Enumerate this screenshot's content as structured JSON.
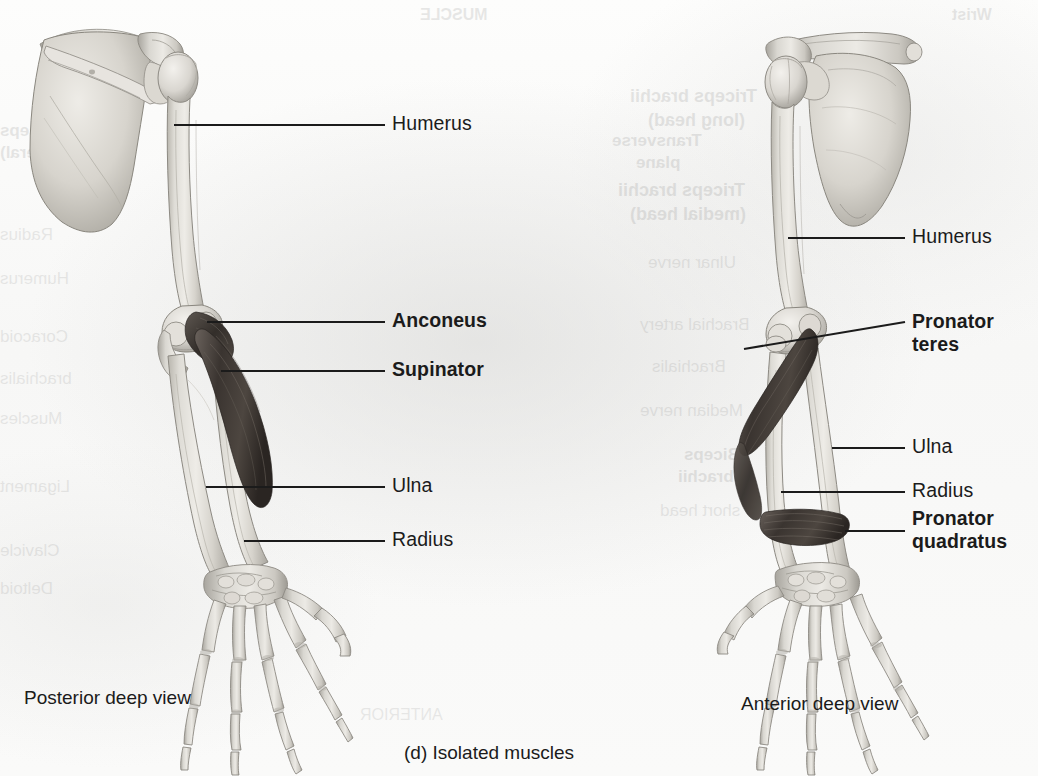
{
  "figure": {
    "panel_caption": "(d) Isolated muscles",
    "left_view_caption": "Posterior deep view",
    "right_view_caption": "Anterior deep view",
    "background_color": "#fbfbfa",
    "bone_color": "#d8d6d0",
    "muscle_color": "#4a4440",
    "leader_color": "#1b1b1b",
    "text_color": "#1b1b1b"
  },
  "left_panel": {
    "name": "posterior-deep-view",
    "labels": [
      {
        "id": "humerus",
        "text": "Humerus",
        "bold": false,
        "lines": [
          "Humerus"
        ]
      },
      {
        "id": "anconeus",
        "text": "Anconeus",
        "bold": true,
        "lines": [
          "Anconeus"
        ]
      },
      {
        "id": "supinator",
        "text": "Supinator",
        "bold": true,
        "lines": [
          "Supinator"
        ]
      },
      {
        "id": "ulna",
        "text": "Ulna",
        "bold": false,
        "lines": [
          "Ulna"
        ]
      },
      {
        "id": "radius",
        "text": "Radius",
        "bold": false,
        "lines": [
          "Radius"
        ]
      }
    ]
  },
  "right_panel": {
    "name": "anterior-deep-view",
    "labels": [
      {
        "id": "humerus",
        "text": "Humerus",
        "bold": false,
        "lines": [
          "Humerus"
        ]
      },
      {
        "id": "pronator-teres",
        "text": "Pronator teres",
        "bold": true,
        "lines": [
          "Pronator",
          "teres"
        ]
      },
      {
        "id": "ulna",
        "text": "Ulna",
        "bold": false,
        "lines": [
          "Ulna"
        ]
      },
      {
        "id": "radius",
        "text": "Radius",
        "bold": false,
        "lines": [
          "Radius"
        ]
      },
      {
        "id": "pronator-quadratus",
        "text": "Pronator quadratus",
        "bold": true,
        "lines": [
          "Pronator",
          "quadratus"
        ]
      }
    ]
  },
  "bleed_through": {
    "note": "faint mirror-image text showing through from the reverse side of the printed page",
    "items": [
      {
        "id": "bt-1",
        "text": "Triceps brachii",
        "x": 630,
        "y": 86,
        "size": 18,
        "bold": true
      },
      {
        "id": "bt-2",
        "text": "(long head)",
        "x": 648,
        "y": 110,
        "size": 18,
        "bold": true
      },
      {
        "id": "bt-3",
        "text": "Triceps brachii",
        "x": 618,
        "y": 180,
        "size": 18,
        "bold": true
      },
      {
        "id": "bt-4",
        "text": "(medial head)",
        "x": 630,
        "y": 204,
        "size": 18,
        "bold": true
      },
      {
        "id": "bt-5",
        "text": "Ulnar nerve",
        "x": 648,
        "y": 252,
        "size": 17,
        "bold": false
      },
      {
        "id": "bt-6",
        "text": "Brachial artery",
        "x": 640,
        "y": 314,
        "size": 17,
        "bold": false
      },
      {
        "id": "bt-7",
        "text": "Brachialis",
        "x": 652,
        "y": 356,
        "size": 17,
        "bold": false
      },
      {
        "id": "bt-8",
        "text": "Median nerve",
        "x": 640,
        "y": 400,
        "size": 17,
        "bold": false
      },
      {
        "id": "bt-9",
        "text": "Biceps",
        "x": 684,
        "y": 444,
        "size": 17,
        "bold": true
      },
      {
        "id": "bt-10",
        "text": "brachii",
        "x": 678,
        "y": 466,
        "size": 17,
        "bold": true
      },
      {
        "id": "bt-11",
        "text": "short head",
        "x": 660,
        "y": 500,
        "size": 17,
        "bold": false
      },
      {
        "id": "bt-12",
        "text": "Transverse",
        "x": 612,
        "y": 130,
        "size": 17,
        "bold": true
      },
      {
        "id": "bt-13",
        "text": "plane",
        "x": 636,
        "y": 152,
        "size": 17,
        "bold": true
      },
      {
        "id": "bt-14",
        "text": "ANTERIOR",
        "x": 360,
        "y": 704,
        "size": 16,
        "bold": false
      },
      {
        "id": "bt-15",
        "text": "Triceps",
        "x": 0,
        "y": 120,
        "size": 17,
        "bold": true
      },
      {
        "id": "bt-16",
        "text": "(lateral)",
        "x": 0,
        "y": 142,
        "size": 17,
        "bold": true
      },
      {
        "id": "bt-17",
        "text": "Radius",
        "x": 0,
        "y": 224,
        "size": 17,
        "bold": false
      },
      {
        "id": "bt-18",
        "text": "Humerus",
        "x": 0,
        "y": 268,
        "size": 17,
        "bold": false
      },
      {
        "id": "bt-19",
        "text": "Coracoid",
        "x": 0,
        "y": 326,
        "size": 17,
        "bold": false
      },
      {
        "id": "bt-20",
        "text": "brachialis",
        "x": 0,
        "y": 368,
        "size": 17,
        "bold": false
      },
      {
        "id": "bt-21",
        "text": "Muscles",
        "x": 0,
        "y": 408,
        "size": 17,
        "bold": false
      },
      {
        "id": "bt-22",
        "text": "Ligament",
        "x": 0,
        "y": 476,
        "size": 17,
        "bold": false
      },
      {
        "id": "bt-23",
        "text": "Clavicle",
        "x": 0,
        "y": 540,
        "size": 17,
        "bold": false
      },
      {
        "id": "bt-24",
        "text": "Deltoid",
        "x": 0,
        "y": 578,
        "size": 17,
        "bold": false
      },
      {
        "id": "bt-25",
        "text": "MUSCLE",
        "x": 420,
        "y": 4,
        "size": 16,
        "bold": true
      },
      {
        "id": "bt-26",
        "text": "Wrist",
        "x": 952,
        "y": 4,
        "size": 16,
        "bold": true
      }
    ]
  },
  "anatomy": {
    "left_arm": {
      "view": "posterior",
      "bones": [
        "scapula",
        "clavicle",
        "humerus",
        "ulna",
        "radius",
        "carpals",
        "metacarpals",
        "phalanges"
      ],
      "muscles": [
        "anconeus",
        "supinator"
      ]
    },
    "right_arm": {
      "view": "anterior",
      "bones": [
        "scapula",
        "clavicle",
        "humerus",
        "ulna",
        "radius",
        "carpals",
        "metacarpals",
        "phalanges"
      ],
      "muscles": [
        "pronator teres",
        "pronator quadratus"
      ]
    }
  }
}
